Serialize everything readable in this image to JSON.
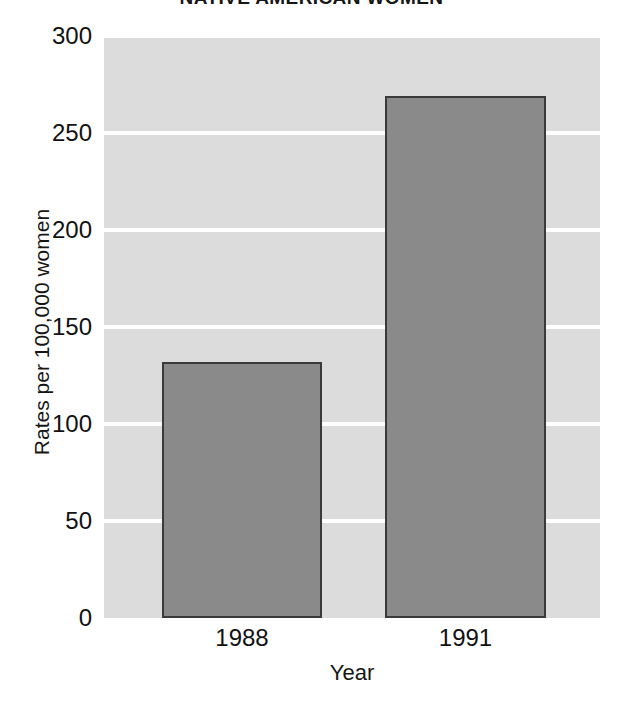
{
  "chart_data": {
    "type": "bar",
    "title": "NATIVE AMERICAN WOMEN",
    "xlabel": "Year",
    "ylabel": "Rates per 100,000 women",
    "categories": [
      "1988",
      "1991"
    ],
    "values": [
      132,
      269
    ],
    "ylim": [
      0,
      300
    ],
    "yticks": [
      0,
      50,
      100,
      150,
      200,
      250,
      300
    ],
    "ytick_labels": [
      "0",
      "50",
      "100",
      "150",
      "200",
      "250",
      "300"
    ],
    "grid": true,
    "grid_color": "#ffffff",
    "legend": null,
    "plot_background": "#dcdcdc",
    "bar_fill": "#8a8a8a",
    "bar_edge": "#3a3a3a",
    "figure_background": "#ffffff"
  }
}
